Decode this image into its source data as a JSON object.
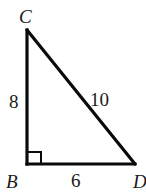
{
  "diagram": {
    "type": "right-triangle",
    "colors": {
      "stroke": "#0a0a0a",
      "text": "#1a1a1a",
      "background": "#ffffff"
    },
    "vertices": {
      "C": {
        "label": "C"
      },
      "B": {
        "label": "B",
        "right_angle": true
      },
      "D": {
        "label": "D"
      }
    },
    "sides": {
      "CB": {
        "label": "8"
      },
      "CD": {
        "label": "10"
      },
      "BD": {
        "label": "6"
      }
    }
  }
}
